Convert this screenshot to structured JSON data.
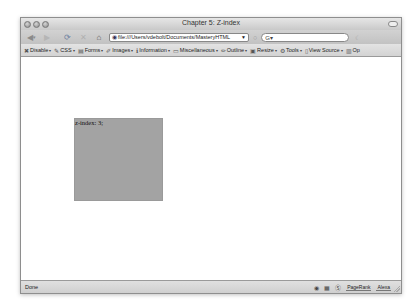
{
  "window": {
    "title": "Chapter 5: Z-index"
  },
  "navbar": {
    "back_icon": "◀",
    "back_drop": "▾",
    "forward_icon": "▶",
    "reload_icon": "⟳",
    "stop_icon": "✕",
    "home_icon": "⌂",
    "url": "file:///Users/vdebolt/Documents/MasteryHTML",
    "url_icon": "◉",
    "url_dropdown": "▼",
    "go_icon": "○",
    "search_placeholder": "G▾",
    "search_go": "☾"
  },
  "devbar": {
    "items": [
      {
        "icon": "✖",
        "label": "Disable"
      },
      {
        "icon": "✎",
        "label": "CSS"
      },
      {
        "icon": "▤",
        "label": "Forms"
      },
      {
        "icon": "✐",
        "label": "Images"
      },
      {
        "icon": "ℹ",
        "label": "Information"
      },
      {
        "icon": "▭",
        "label": "Miscellaneous"
      },
      {
        "icon": "✏",
        "label": "Outline"
      },
      {
        "icon": "▣",
        "label": "Resize"
      },
      {
        "icon": "⚙",
        "label": "Tools"
      },
      {
        "icon": "▯",
        "label": "View Source"
      },
      {
        "icon": "▥",
        "label": "Op"
      }
    ],
    "arrow": "▾"
  },
  "content": {
    "box_text": "z-index: 3;",
    "box_color": "#a3a3a3"
  },
  "statusbar": {
    "text": "Done",
    "icons": [
      "◉",
      "▦",
      "Ⓢ"
    ],
    "pagerank_label": "PageRank",
    "alexa_label": "Alexa"
  }
}
